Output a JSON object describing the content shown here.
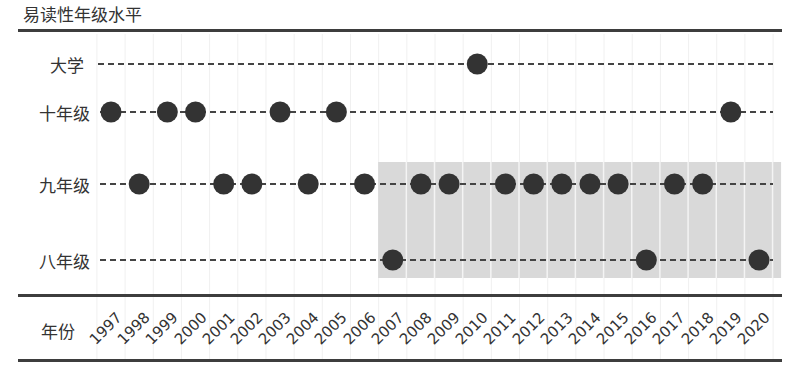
{
  "title": "易读性年级水平",
  "colors": {
    "dot": "#333333",
    "dash": "#444444",
    "shade": "#d9d9d9",
    "grid": "#f0f0f0",
    "rule": "#3d3d3d"
  },
  "x_axis_label": "年份",
  "chart_data": {
    "type": "scatter",
    "title": "易读性年级水平",
    "xlabel": "年份",
    "ylabel": "",
    "x": [
      1997,
      1998,
      1999,
      2000,
      2001,
      2002,
      2003,
      2004,
      2005,
      2006,
      2007,
      2008,
      2009,
      2010,
      2011,
      2012,
      2013,
      2014,
      2015,
      2016,
      2017,
      2018,
      2019,
      2020
    ],
    "categories_y": [
      "大学",
      "十年级",
      "九年级",
      "八年级"
    ],
    "values": [
      {
        "year": 1997,
        "level": "十年级"
      },
      {
        "year": 1998,
        "level": "九年级"
      },
      {
        "year": 1999,
        "level": "十年级"
      },
      {
        "year": 2000,
        "level": "十年级"
      },
      {
        "year": 2001,
        "level": "九年级"
      },
      {
        "year": 2002,
        "level": "九年级"
      },
      {
        "year": 2003,
        "level": "十年级"
      },
      {
        "year": 2004,
        "level": "九年级"
      },
      {
        "year": 2005,
        "level": "十年级"
      },
      {
        "year": 2006,
        "level": "九年级"
      },
      {
        "year": 2007,
        "level": "八年级"
      },
      {
        "year": 2008,
        "level": "九年级"
      },
      {
        "year": 2009,
        "level": "九年级"
      },
      {
        "year": 2010,
        "level": "大学"
      },
      {
        "year": 2011,
        "level": "九年级"
      },
      {
        "year": 2012,
        "level": "九年级"
      },
      {
        "year": 2013,
        "level": "九年级"
      },
      {
        "year": 2014,
        "level": "九年级"
      },
      {
        "year": 2015,
        "level": "九年级"
      },
      {
        "year": 2016,
        "level": "八年级"
      },
      {
        "year": 2017,
        "level": "九年级"
      },
      {
        "year": 2018,
        "level": "九年级"
      },
      {
        "year": 2019,
        "level": "十年级"
      },
      {
        "year": 2020,
        "level": "八年级"
      }
    ],
    "highlight_region": {
      "from_year": 2007,
      "to_year": 2020,
      "levels": [
        "九年级",
        "八年级"
      ]
    },
    "grid": true,
    "legend": null
  },
  "rows": [
    {
      "label": "大学",
      "y": 64,
      "label_x": 50,
      "line_start": 98
    },
    {
      "label": "十年级",
      "y": 112,
      "label_x": 39,
      "line_start": 100
    },
    {
      "label": "九年级",
      "y": 184,
      "label_x": 39,
      "line_start": 100
    },
    {
      "label": "八年级",
      "y": 260,
      "label_x": 39,
      "line_start": 100
    }
  ]
}
